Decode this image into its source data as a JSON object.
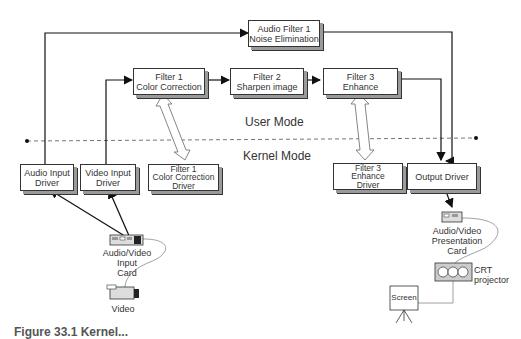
{
  "diagram": {
    "boxes": {
      "audio_filter": "Audio Filter 1\nNoise Elimination",
      "filter1": "Filter 1\nColor Correction",
      "filter2": "Filter 2\nSharpen image",
      "filter3": "Filter 3\nEnhance",
      "audio_input_driver": "Audio Input\nDriver",
      "video_input_driver": "Video Input\nDriver",
      "filter1_driver": "Filter 1\nColor Correction\nDriver",
      "filter3_driver": "Filter 3\nEnhance\nDriver",
      "output_driver": "Output Driver"
    },
    "modes": {
      "user": "User Mode",
      "kernel": "Kernel Mode"
    },
    "devices": {
      "av_input_card": "Audio/Video Input\nCard",
      "video": "Video",
      "av_presentation_card": "Audio/Video Presentation\nCard",
      "crt_projector": "CRT\nprojector",
      "screen": "Screen"
    },
    "caption": "Figure 33.1 Kernel..."
  }
}
